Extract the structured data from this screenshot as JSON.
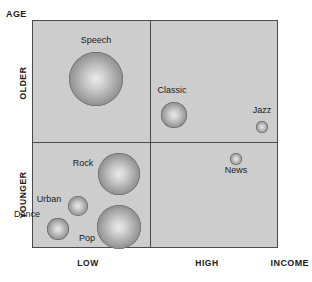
{
  "axes": {
    "y_title": "AGE",
    "x_title": "INCOME",
    "y_ticks": [
      "OLDER",
      "YOUNGER"
    ],
    "x_ticks": [
      "LOW",
      "HIGH"
    ]
  },
  "colors": {
    "plot_background": "#cdcdcd",
    "border": "#4a4a4a",
    "bubble_center": "#eaeaea",
    "bubble_edge": "#6e6e6e",
    "text": "#1a1a1a"
  },
  "bubbles": [
    {
      "label": "Speech",
      "quadrant": "older-low",
      "cx": 95,
      "cy": 78,
      "r": 27
    },
    {
      "label": "Classic",
      "quadrant": "older-high",
      "cx": 173,
      "cy": 114,
      "r": 13
    },
    {
      "label": "Jazz",
      "quadrant": "older-high",
      "cx": 261,
      "cy": 126,
      "r": 6
    },
    {
      "label": "Rock",
      "quadrant": "younger-low",
      "cx": 118,
      "cy": 173,
      "r": 21
    },
    {
      "label": "Urban",
      "quadrant": "younger-low",
      "cx": 77,
      "cy": 205,
      "r": 10
    },
    {
      "label": "Dance",
      "quadrant": "younger-low",
      "cx": 57,
      "cy": 228,
      "r": 11
    },
    {
      "label": "Pop",
      "quadrant": "younger-low",
      "cx": 118,
      "cy": 226,
      "r": 22
    },
    {
      "label": "News",
      "quadrant": "younger-high",
      "cx": 235,
      "cy": 158,
      "r": 6
    }
  ],
  "chart_data": {
    "type": "scatter",
    "title": "",
    "xlabel": "INCOME",
    "ylabel": "AGE",
    "xticks": [
      "LOW",
      "HIGH"
    ],
    "yticks": [
      "YOUNGER",
      "OLDER"
    ],
    "grid": false,
    "legend": "none",
    "note": "Bubble chart: bubble area encodes relative audience size; x = income (low/high), y = age (younger/older).",
    "points": [
      {
        "name": "Speech",
        "income": "LOW",
        "age": "OLDER",
        "size": 27
      },
      {
        "name": "Classic",
        "income": "HIGH",
        "age": "OLDER",
        "size": 13
      },
      {
        "name": "Jazz",
        "income": "HIGH",
        "age": "OLDER",
        "size": 6
      },
      {
        "name": "Rock",
        "income": "LOW",
        "age": "YOUNGER",
        "size": 21
      },
      {
        "name": "Pop",
        "income": "LOW",
        "age": "YOUNGER",
        "size": 22
      },
      {
        "name": "Urban",
        "income": "LOW",
        "age": "YOUNGER",
        "size": 10
      },
      {
        "name": "Dance",
        "income": "LOW",
        "age": "YOUNGER",
        "size": 11
      },
      {
        "name": "News",
        "income": "HIGH",
        "age": "YOUNGER",
        "size": 6
      }
    ]
  }
}
